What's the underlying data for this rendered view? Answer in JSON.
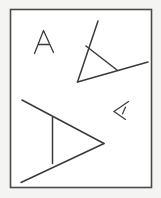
{
  "document": {
    "title": "Hand-drawn shapes sketch",
    "description": "Four hand-drawn letter-A shapes at different sizes and rotations inside a rectangular frame",
    "width": 161,
    "height": 198
  },
  "colors": {
    "page_background": "#f4f4f2",
    "canvas_background": "#ffffff",
    "frame_stroke": "#4a4a4a",
    "ink": "#3a3a3a"
  },
  "frame": {
    "label": "drawing-frame",
    "x": 10,
    "y": 9,
    "width": 142,
    "height": 179
  },
  "shapes": [
    {
      "name": "letter-a-upright-small",
      "glyph": "A",
      "rotation_deg": 0,
      "scale": "small",
      "position": {
        "x": 33,
        "y": 30,
        "width": 21,
        "height": 24
      },
      "strokes": [
        "M 34.5 53.5 L 43.5 30.5 L 53.5 52.5",
        "M 38.5 44.5 L 49.0 44.5"
      ]
    },
    {
      "name": "letter-a-rotated-medium",
      "glyph": "A",
      "rotation_deg": -55,
      "scale": "medium",
      "position": {
        "x": 76,
        "y": 20,
        "width": 73,
        "height": 63
      },
      "strokes": [
        "M 98.0 21.0 L 77.5 82.0",
        "M 77.5 82.0 L 148.0 62.0",
        "M 86.0 46.0 L 117.0 70.0"
      ]
    },
    {
      "name": "letter-a-rotated-large",
      "glyph": "A",
      "rotation_deg": -90,
      "scale": "large",
      "position": {
        "x": 21,
        "y": 99,
        "width": 84,
        "height": 84
      },
      "strokes": [
        "M 22.0 100.0 L 104.0 143.5",
        "M 104.0 143.5 L 21.0 182.5",
        "M 52.5 117.5 L 52.5 163.5"
      ]
    },
    {
      "name": "letter-a-rotated-tiny",
      "glyph": "A",
      "rotation_deg": 165,
      "scale": "tiny",
      "position": {
        "x": 113,
        "y": 101,
        "width": 16,
        "height": 19
      },
      "strokes": [
        "M 128.5 101.5 L 114.0 111.5",
        "M 114.0 111.5 L 125.5 119.5",
        "M 125.5 107.0 L 122.5 114.0"
      ]
    }
  ]
}
